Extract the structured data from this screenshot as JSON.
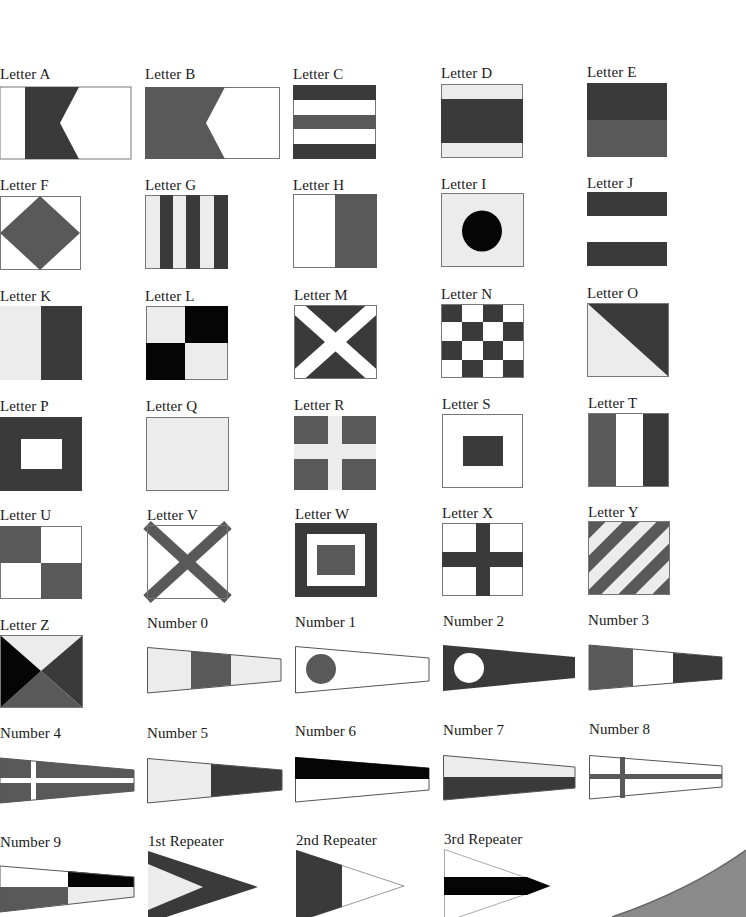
{
  "page": {
    "colors": {
      "dark": "#3a3a3a",
      "mid": "#595959",
      "black": "#050505",
      "light": "#ececec",
      "white": "#ffffff",
      "outline": "#777777"
    }
  },
  "flags": [
    {
      "id": "letter-a",
      "label": "Letter A",
      "shape": "rect"
    },
    {
      "id": "letter-b",
      "label": "Letter B",
      "shape": "rect"
    },
    {
      "id": "letter-c",
      "label": "Letter C",
      "shape": "rect"
    },
    {
      "id": "letter-d",
      "label": "Letter D",
      "shape": "rect"
    },
    {
      "id": "letter-e",
      "label": "Letter E",
      "shape": "rect"
    },
    {
      "id": "letter-f",
      "label": "Letter F",
      "shape": "rect"
    },
    {
      "id": "letter-g",
      "label": "Letter G",
      "shape": "rect"
    },
    {
      "id": "letter-h",
      "label": "Letter H",
      "shape": "rect"
    },
    {
      "id": "letter-i",
      "label": "Letter I",
      "shape": "rect"
    },
    {
      "id": "letter-j",
      "label": "Letter J",
      "shape": "rect"
    },
    {
      "id": "letter-k",
      "label": "Letter K",
      "shape": "rect"
    },
    {
      "id": "letter-l",
      "label": "Letter L",
      "shape": "rect"
    },
    {
      "id": "letter-m",
      "label": "Letter M",
      "shape": "rect"
    },
    {
      "id": "letter-n",
      "label": "Letter N",
      "shape": "rect"
    },
    {
      "id": "letter-o",
      "label": "Letter O",
      "shape": "rect"
    },
    {
      "id": "letter-p",
      "label": "Letter P",
      "shape": "rect"
    },
    {
      "id": "letter-q",
      "label": "Letter Q",
      "shape": "rect"
    },
    {
      "id": "letter-r",
      "label": "Letter R",
      "shape": "rect"
    },
    {
      "id": "letter-s",
      "label": "Letter S",
      "shape": "rect"
    },
    {
      "id": "letter-t",
      "label": "Letter T",
      "shape": "rect"
    },
    {
      "id": "letter-u",
      "label": "Letter U",
      "shape": "rect"
    },
    {
      "id": "letter-v",
      "label": "Letter V",
      "shape": "rect"
    },
    {
      "id": "letter-w",
      "label": "Letter W",
      "shape": "rect"
    },
    {
      "id": "letter-x",
      "label": "Letter X",
      "shape": "rect"
    },
    {
      "id": "letter-y",
      "label": "Letter Y",
      "shape": "rect"
    },
    {
      "id": "letter-z",
      "label": "Letter Z",
      "shape": "rect"
    },
    {
      "id": "number-0",
      "label": "Number 0",
      "shape": "pennant"
    },
    {
      "id": "number-1",
      "label": "Number 1",
      "shape": "pennant"
    },
    {
      "id": "number-2",
      "label": "Number 2",
      "shape": "pennant"
    },
    {
      "id": "number-3",
      "label": "Number 3",
      "shape": "pennant"
    },
    {
      "id": "number-4",
      "label": "Number 4",
      "shape": "pennant"
    },
    {
      "id": "number-5",
      "label": "Number 5",
      "shape": "pennant"
    },
    {
      "id": "number-6",
      "label": "Number 6",
      "shape": "pennant"
    },
    {
      "id": "number-7",
      "label": "Number 7",
      "shape": "pennant"
    },
    {
      "id": "number-8",
      "label": "Number 8",
      "shape": "pennant"
    },
    {
      "id": "number-9",
      "label": "Number 9",
      "shape": "pennant"
    },
    {
      "id": "repeater-1",
      "label": "1st Repeater",
      "shape": "triangle"
    },
    {
      "id": "repeater-2",
      "label": "2nd Repeater",
      "shape": "triangle"
    },
    {
      "id": "repeater-3",
      "label": "3rd Repeater",
      "shape": "triangle"
    }
  ]
}
